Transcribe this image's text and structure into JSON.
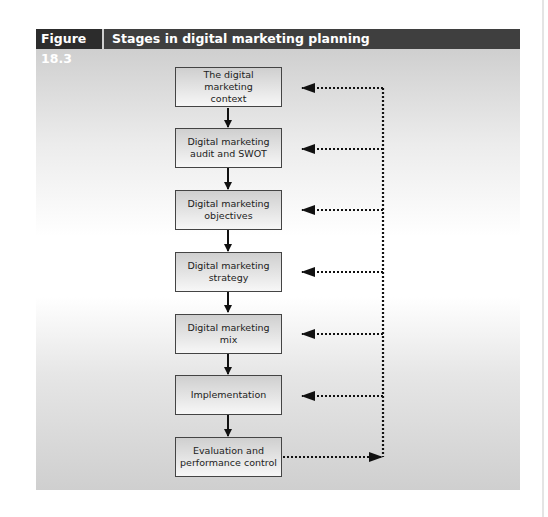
{
  "figure": {
    "number": "Figure 18.3",
    "title": "Stages in digital marketing planning"
  },
  "stages": [
    {
      "line1": "The digital marketing",
      "line2": "context"
    },
    {
      "line1": "Digital marketing",
      "line2": "audit and SWOT"
    },
    {
      "line1": "Digital marketing",
      "line2": "objectives"
    },
    {
      "line1": "Digital marketing",
      "line2": "strategy"
    },
    {
      "line1": "Digital marketing",
      "line2": "mix"
    },
    {
      "line1": "Implementation",
      "line2": ""
    },
    {
      "line1": "Evaluation and",
      "line2": "performance control"
    }
  ],
  "colors": {
    "header_bg": "#3f3f3f",
    "fig_num_bg": "#2c2c2c",
    "arrow": "#111111"
  }
}
